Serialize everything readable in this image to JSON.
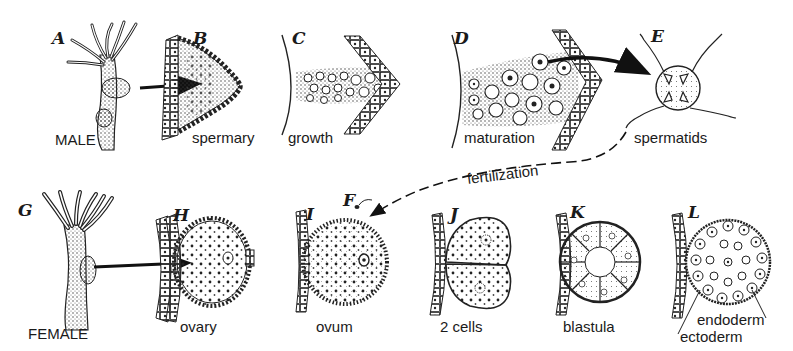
{
  "figure": {
    "panels": [
      {
        "letter": "A",
        "caption": "MALE"
      },
      {
        "letter": "B",
        "caption": "spermary"
      },
      {
        "letter": "C",
        "caption": "growth"
      },
      {
        "letter": "D",
        "caption": "maturation"
      },
      {
        "letter": "E",
        "caption": "spermatids"
      },
      {
        "letter": "F",
        "caption": ""
      },
      {
        "letter": "G",
        "caption": "FEMALE"
      },
      {
        "letter": "H",
        "caption": "ovary"
      },
      {
        "letter": "I",
        "caption": "ovum"
      },
      {
        "letter": "J",
        "caption": "2 cells"
      },
      {
        "letter": "K",
        "caption": "blastula"
      },
      {
        "letter": "L",
        "caption": ""
      }
    ],
    "connector_label": "fertilization",
    "layer_labels": {
      "inner": "endoderm",
      "outer": "ectoderm"
    }
  }
}
